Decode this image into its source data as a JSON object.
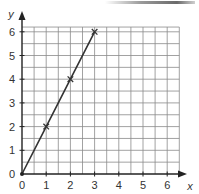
{
  "chart_data": {
    "type": "line",
    "title": "",
    "xlabel": "x",
    "ylabel": "y",
    "xlim": [
      0,
      6.5
    ],
    "ylim": [
      0,
      6.2
    ],
    "grid": true,
    "grid_minor_step": 0.5,
    "x_ticks": [
      "0",
      "1",
      "2",
      "3",
      "4",
      "5",
      "6"
    ],
    "y_ticks": [
      "0",
      "1",
      "2",
      "3",
      "4",
      "5",
      "6"
    ],
    "series": [
      {
        "name": "line",
        "x": [
          0,
          1,
          2,
          3
        ],
        "y": [
          0,
          2,
          4,
          6
        ],
        "markers": "cross",
        "marked_points": [
          [
            1,
            2
          ],
          [
            2,
            4
          ],
          [
            3,
            6
          ]
        ]
      }
    ],
    "legend": null
  },
  "colors": {
    "grid": "#8a8a8a",
    "axis": "#222222",
    "line": "#333333"
  }
}
